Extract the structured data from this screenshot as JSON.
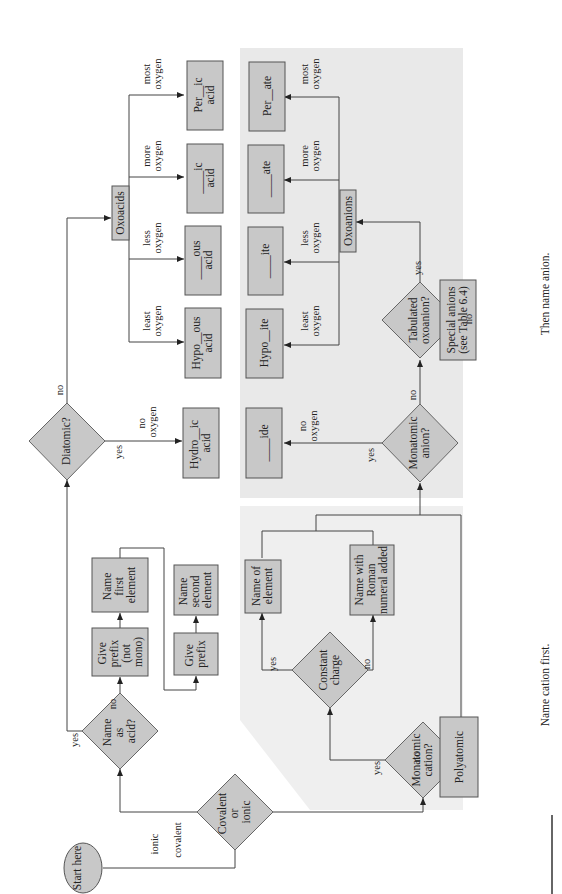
{
  "diagram": {
    "type": "flowchart",
    "orientation": "rotated-90-ccw",
    "colors": {
      "box_fill": "#c8c8c8",
      "cation_region": "#efefef",
      "anion_region": "#e9e9e9",
      "line": "#444444"
    },
    "start": "Start here",
    "decision_bond": {
      "l1": "Covalent",
      "l2": "or",
      "l3": "ionic"
    },
    "edge_covalent": "covalent",
    "edge_ionic": "ionic",
    "decision_acid": {
      "l1": "Name",
      "l2": "as",
      "l3": "acid?"
    },
    "yes": "yes",
    "no": "no",
    "give_prefix_not_mono": {
      "l1": "Give",
      "l2": "prefix",
      "l3": "(not",
      "l4": "mono)"
    },
    "name_first": {
      "l1": "Name",
      "l2": "first",
      "l3": "element"
    },
    "give_prefix": {
      "l1": "Give",
      "l2": "prefix"
    },
    "name_second": {
      "l1": "Name",
      "l2": "second",
      "l3": "element"
    },
    "decision_diatomic": "Diatomic?",
    "edge_no_oxygen": {
      "l1": "no",
      "l2": "oxygen"
    },
    "hydro_ic": {
      "l1": "Hydro__ic",
      "l2": "acid"
    },
    "oxoacids": "Oxoacids",
    "acid_edges": [
      {
        "l1": "least",
        "l2": "oxygen"
      },
      {
        "l1": "less",
        "l2": "oxygen"
      },
      {
        "l1": "more",
        "l2": "oxygen"
      },
      {
        "l1": "most",
        "l2": "oxygen"
      }
    ],
    "acids": [
      {
        "l1": "Hypo__ous",
        "l2": "acid"
      },
      {
        "l1": "____ous",
        "l2": "acid"
      },
      {
        "l1": "____ic",
        "l2": "acid"
      },
      {
        "l1": "Per__ic",
        "l2": "acid"
      }
    ],
    "decision_mono_cation": {
      "l1": "Monatomic",
      "l2": "cation?"
    },
    "decision_constant": {
      "l1": "Constant",
      "l2": "charge"
    },
    "name_of_element": {
      "l1": "Name of",
      "l2": "element"
    },
    "name_roman": {
      "l1": "Name with",
      "l2": "Roman",
      "l3": "numeral added"
    },
    "polyatomic": "Polyatomic",
    "decision_mono_anion": {
      "l1": "Monatomic",
      "l2": "anion?"
    },
    "ide": "____ide",
    "decision_tabulated": {
      "l1": "Tabulated",
      "l2": "oxoanion?"
    },
    "oxoanions": "Oxoanions",
    "special_anions": {
      "l1": "Special anions",
      "l2": "(see Table 6.4)"
    },
    "anions": [
      "Hypo__ite",
      "____ite",
      "____ate",
      "Per__ate"
    ],
    "caption_cation": "Name cation first.",
    "caption_anion": "Then name anion."
  }
}
